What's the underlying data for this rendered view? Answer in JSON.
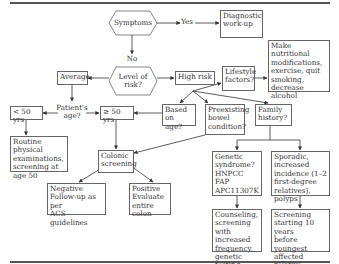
{
  "nodes": {
    "symptoms": "Symptoms",
    "yes": "Yes",
    "diagnostic": "Diagnostic\nwork-up",
    "no": "No",
    "level_of_risk": "Level of\nrisk?",
    "average": "Average",
    "high_risk": "High risk",
    "lifestyle": "Lifestyle\nfactors?",
    "lifestyle_action": "Make nutritional\nmodifications,\nexercise, quit\nsmoking,\ndecrease alcohol",
    "patients_age": "Patient's\nage?",
    "under_50": "< 50 yrs",
    "over_50": "≥ 50 yrs",
    "based_on_age": "Based on\nage?",
    "preexisting": "Preexisting\nbowel\ncondition?",
    "family_history": "Family\nhistory?",
    "routine": "Routine physical\nexaminations,\nscreening at\nage 50",
    "colonic_screening": "Colonic\nscreening",
    "negative": "Negative\nFollow-up as per\nACS guidelines",
    "positive": "Positive\nEvaluate entire\ncolon",
    "genetic": "Genetic\nsyndrome?\nHNPCC\nFAP\nAPC11307K",
    "sporadic": "Sporadic,\nincreased\nincidence (1–2\nfirst-degree\nrelatives), polyps",
    "counseling": "Counseling,\nscreening with\nincreased\nfrequency,\ngenetic testing",
    "screening_10": "Screening\nstarting 10 years\nbefore youngest\naffected relative"
  },
  "colors": {
    "line": "#333333",
    "border": "#666666",
    "text": "#333333"
  }
}
